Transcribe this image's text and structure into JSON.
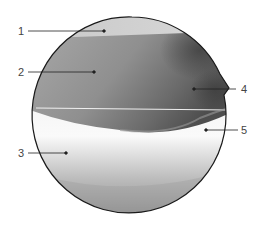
{
  "figure": {
    "type": "arthroscopic-view-diagram",
    "labels": [
      {
        "number": "1",
        "side": "left"
      },
      {
        "number": "2",
        "side": "left"
      },
      {
        "number": "3",
        "side": "left"
      },
      {
        "number": "4",
        "side": "right"
      },
      {
        "number": "5",
        "side": "right"
      }
    ],
    "colors": {
      "outline": "#1a1a1a",
      "leader": "#222222",
      "label_text": "#444444",
      "region_top": "#cfcfcf",
      "region_mid": "#8e8e8e",
      "region_dark": "#555555",
      "region_bright": "#f4f4f4"
    }
  }
}
